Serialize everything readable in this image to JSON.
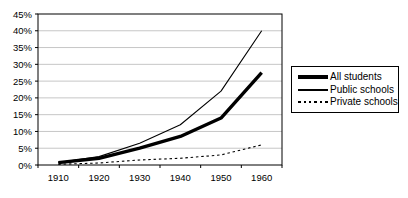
{
  "chart_data": {
    "type": "line",
    "title": "",
    "xlabel": "",
    "ylabel": "",
    "categories": [
      "1910",
      "1920",
      "1930",
      "1940",
      "1950",
      "1960"
    ],
    "series": [
      {
        "name": "All students",
        "style": "thick-solid",
        "values": [
          0.7,
          2.0,
          5.0,
          8.5,
          14.0,
          27.5
        ]
      },
      {
        "name": "Public schools",
        "style": "thin-solid",
        "values": [
          0.7,
          2.5,
          6.5,
          12.0,
          22.0,
          40.0
        ]
      },
      {
        "name": "Private schools",
        "style": "dashed",
        "values": [
          0.2,
          0.6,
          1.5,
          2.0,
          3.0,
          6.0
        ]
      }
    ],
    "ylim": [
      0,
      45
    ],
    "ytick_step": 5,
    "ytick_labels": [
      "0%",
      "5%",
      "10%",
      "15%",
      "20%",
      "25%",
      "30%",
      "35%",
      "40%",
      "45%"
    ],
    "grid": true,
    "legend_position": "right"
  },
  "colors": {
    "line": "#000000",
    "grid": "#c6c6c6",
    "background": "#ffffff",
    "text": "#000000"
  }
}
